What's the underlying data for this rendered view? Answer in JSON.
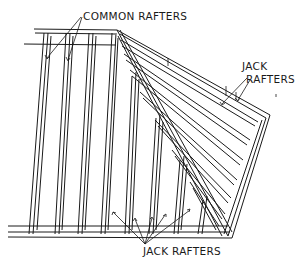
{
  "diagram": {
    "labels": {
      "common_rafters": "COMMON RAFTERS",
      "jack_rafters_top_line1": "JACK",
      "jack_rafters_top_line2": "RAFTERS",
      "jack_rafters_bottom": "JACK RAFTERS"
    },
    "colors": {
      "ink": "#1a1a1a",
      "background": "#ffffff"
    }
  }
}
